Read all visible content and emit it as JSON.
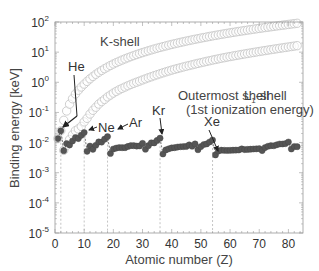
{
  "chart_data": {
    "type": "scatter",
    "title": "",
    "xlabel": "Atomic number (Z)",
    "ylabel": "Binding energy [keV]",
    "xlim": [
      0,
      85
    ],
    "ylim_log10": [
      -5,
      2
    ],
    "yscale": "log",
    "xticks": [
      0,
      10,
      20,
      30,
      40,
      50,
      60,
      70,
      80
    ],
    "yticks": [
      "10^-5",
      "10^-4",
      "10^-3",
      "10^-2",
      "10^-1",
      "10^0",
      "10^1",
      "10^2"
    ],
    "grid": false,
    "reference_lines_x": [
      2,
      10,
      18,
      36,
      54
    ],
    "series": [
      {
        "name": "K-shell",
        "marker": "open-circle",
        "x": [
          1,
          2,
          3,
          4,
          5,
          6,
          7,
          8,
          9,
          10,
          11,
          12,
          13,
          14,
          15,
          16,
          17,
          18,
          19,
          20,
          21,
          22,
          23,
          24,
          25,
          26,
          27,
          28,
          29,
          30,
          31,
          32,
          33,
          34,
          35,
          36,
          37,
          38,
          39,
          40,
          41,
          42,
          43,
          44,
          45,
          46,
          47,
          48,
          49,
          50,
          51,
          52,
          53,
          54,
          55,
          56,
          57,
          58,
          59,
          60,
          61,
          62,
          63,
          64,
          65,
          66,
          67,
          68,
          69,
          70,
          71,
          72,
          73,
          74,
          75,
          76,
          77,
          78,
          79,
          80,
          81,
          82,
          83
        ],
        "values_keV": [
          0.0136,
          0.0246,
          0.0548,
          0.1117,
          0.188,
          0.2842,
          0.4099,
          0.5431,
          0.6967,
          0.8702,
          1.0721,
          1.305,
          1.5596,
          1.8389,
          2.1455,
          2.472,
          2.8224,
          3.2029,
          3.6074,
          4.0381,
          4.4928,
          4.9664,
          5.4651,
          5.9892,
          6.539,
          7.112,
          7.7089,
          8.3328,
          8.9789,
          9.6586,
          10.367,
          11.103,
          11.867,
          12.658,
          13.474,
          14.326,
          15.2,
          16.105,
          17.038,
          17.998,
          18.986,
          20.0,
          21.044,
          22.117,
          23.22,
          24.35,
          25.514,
          26.711,
          27.94,
          29.2,
          30.491,
          31.814,
          33.169,
          34.561,
          35.985,
          37.441,
          38.925,
          40.443,
          41.991,
          43.569,
          45.184,
          46.834,
          48.519,
          50.239,
          51.996,
          53.789,
          55.618,
          57.486,
          59.39,
          61.332,
          63.314,
          65.351,
          67.416,
          69.525,
          71.676,
          73.871,
          76.111,
          78.395,
          80.725,
          83.102,
          85.53,
          88.005,
          90.526
        ],
        "label_pos": {
          "x": 100,
          "y": 40
        }
      },
      {
        "name": "L1-shell",
        "marker": "open-circle",
        "x": [
          3,
          4,
          5,
          6,
          7,
          8,
          9,
          10,
          11,
          12,
          13,
          14,
          15,
          16,
          17,
          18,
          19,
          20,
          21,
          22,
          23,
          24,
          25,
          26,
          27,
          28,
          29,
          30,
          31,
          32,
          33,
          34,
          35,
          36,
          37,
          38,
          39,
          40,
          41,
          42,
          43,
          44,
          45,
          46,
          47,
          48,
          49,
          50,
          51,
          52,
          53,
          54,
          55,
          56,
          57,
          58,
          59,
          60,
          61,
          62,
          63,
          64,
          65,
          66,
          67,
          68,
          69,
          70,
          71,
          72,
          73,
          74,
          75,
          76,
          77,
          78,
          79,
          80,
          81,
          82,
          83
        ],
        "values_keV": [
          0.0055,
          0.008,
          0.0126,
          0.0181,
          0.0247,
          0.0285,
          0.0343,
          0.0485,
          0.0636,
          0.0886,
          0.1177,
          0.1487,
          0.1893,
          0.2292,
          0.2702,
          0.3263,
          0.3771,
          0.4384,
          0.5004,
          0.5637,
          0.6282,
          0.6946,
          0.769,
          0.8461,
          0.9256,
          1.0081,
          1.0961,
          1.1936,
          1.2977,
          1.4143,
          1.5265,
          1.6539,
          1.782,
          1.921,
          2.0651,
          2.2163,
          2.3725,
          2.5316,
          2.6977,
          2.8655,
          3.043,
          3.224,
          3.4119,
          3.6043,
          3.8058,
          4.018,
          4.2375,
          4.4647,
          4.6983,
          4.9392,
          5.1881,
          5.4528,
          5.7143,
          5.9888,
          6.2663,
          6.5488,
          6.8348,
          7.126,
          7.4279,
          7.7368,
          8.052,
          8.3756,
          8.708,
          9.0458,
          9.3942,
          9.7513,
          10.1157,
          10.4864,
          10.8704,
          11.2707,
          11.6815,
          12.0998,
          12.5267,
          12.968,
          13.4185,
          13.8799,
          14.3528,
          14.8393,
          15.3467,
          15.8608,
          16.3875
        ],
        "label_pos": {
          "x": 244,
          "y": 82
        }
      },
      {
        "name": "Outermost shell (1st ionization energy)",
        "marker": "filled-circle",
        "linestyle": "dashed",
        "x": [
          1,
          2,
          3,
          4,
          5,
          6,
          7,
          8,
          9,
          10,
          11,
          12,
          13,
          14,
          15,
          16,
          17,
          18,
          19,
          20,
          21,
          22,
          23,
          24,
          25,
          26,
          27,
          28,
          29,
          30,
          31,
          32,
          33,
          34,
          35,
          36,
          37,
          38,
          39,
          40,
          41,
          42,
          43,
          44,
          45,
          46,
          47,
          48,
          49,
          50,
          51,
          52,
          53,
          54,
          55,
          56,
          57,
          58,
          59,
          60,
          61,
          62,
          63,
          64,
          65,
          66,
          67,
          68,
          69,
          70,
          71,
          72,
          73,
          74,
          75,
          76,
          77,
          78,
          79,
          80,
          81,
          82,
          83
        ],
        "values_keV": [
          0.0136,
          0.02459,
          0.00539,
          0.00932,
          0.0083,
          0.01126,
          0.01453,
          0.01362,
          0.01742,
          0.02156,
          0.00514,
          0.00765,
          0.00599,
          0.00815,
          0.01049,
          0.01036,
          0.01297,
          0.01576,
          0.00434,
          0.00611,
          0.00656,
          0.00683,
          0.00675,
          0.00677,
          0.00743,
          0.0079,
          0.00788,
          0.00764,
          0.00773,
          0.00939,
          0.006,
          0.0079,
          0.00979,
          0.00975,
          0.01181,
          0.014,
          0.00418,
          0.00569,
          0.00622,
          0.00663,
          0.00676,
          0.00709,
          0.00728,
          0.00736,
          0.00746,
          0.00834,
          0.00758,
          0.00899,
          0.00579,
          0.00734,
          0.00864,
          0.00901,
          0.01045,
          0.01213,
          0.00389,
          0.00521,
          0.00558,
          0.00554,
          0.00547,
          0.00553,
          0.00558,
          0.00564,
          0.00567,
          0.00615,
          0.00586,
          0.00594,
          0.00602,
          0.00611,
          0.00618,
          0.00625,
          0.00543,
          0.00683,
          0.00755,
          0.00786,
          0.00783,
          0.00844,
          0.00897,
          0.00896,
          0.00923,
          0.01044,
          0.00611,
          0.00742,
          0.00729
        ],
        "label": "Outermost shell",
        "label_line2": "(1st ionization energy)"
      }
    ],
    "annotations": [
      {
        "text": "He",
        "z": 2
      },
      {
        "text": "Ne",
        "z": 10
      },
      {
        "text": "Ar",
        "z": 18
      },
      {
        "text": "Kr",
        "z": 36
      },
      {
        "text": "Xe",
        "z": 54
      }
    ]
  },
  "labels": {
    "k_shell": "K-shell",
    "l1_shell_main": "L",
    "l1_shell_sub": "1",
    "l1_shell_rest": "-shell",
    "outer_line1": "Outermost shell",
    "outer_line2": "(1st ionization energy)",
    "he": "He",
    "ne": "Ne",
    "ar": "Ar",
    "kr": "Kr",
    "xe": "Xe",
    "xlabel": "Atomic number (Z)",
    "ylabel": "Binding energy [keV]"
  },
  "colors": {
    "open_marker_stroke": "#c8c8c8",
    "filled_marker": "#555555",
    "dashed_line": "#666666",
    "axis": "#999999",
    "text": "#333333",
    "ref_line": "#aaaaaa"
  }
}
